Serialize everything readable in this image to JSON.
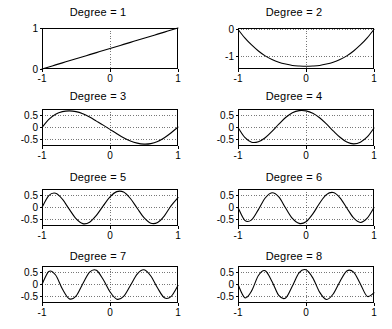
{
  "figure": {
    "kind": "small-multiples-grid",
    "rows": 4,
    "cols": 2,
    "background": "#ffffff",
    "line_color": "#000000",
    "grid_color": "#555555",
    "axis_color": "#000000"
  },
  "chart_data": [
    {
      "type": "line",
      "title": "Degree = 1",
      "xlabel": "",
      "ylabel": "",
      "xlim": [
        -1,
        1
      ],
      "ylim": [
        0,
        1
      ],
      "xticks": [
        -1,
        0,
        1
      ],
      "xticklabels": [
        "-1",
        "0",
        "1"
      ],
      "yticks": [
        0,
        1
      ],
      "yticklabels": [
        "0",
        "1"
      ],
      "grid": true,
      "series": [
        {
          "name": "basis-1",
          "x": [
            -1,
            -0.9,
            -0.8,
            -0.7,
            -0.6,
            -0.5,
            -0.4,
            -0.3,
            -0.2,
            -0.1,
            0,
            0.1,
            0.2,
            0.3,
            0.4,
            0.5,
            0.6,
            0.7,
            0.8,
            0.9,
            1
          ],
          "y": [
            0,
            0.05,
            0.1,
            0.15,
            0.2,
            0.25,
            0.3,
            0.35,
            0.4,
            0.45,
            0.5,
            0.55,
            0.6,
            0.65,
            0.7,
            0.75,
            0.8,
            0.85,
            0.9,
            0.95,
            1
          ]
        }
      ]
    },
    {
      "type": "line",
      "title": "Degree = 2",
      "xlabel": "",
      "ylabel": "",
      "xlim": [
        -1,
        1
      ],
      "ylim": [
        -1.45,
        0.05
      ],
      "xticks": [
        -1,
        0,
        1
      ],
      "xticklabels": [
        "-1",
        "0",
        "1"
      ],
      "yticks": [
        0,
        -1
      ],
      "yticklabels": [
        "0",
        "-1"
      ],
      "grid": true,
      "series": [
        {
          "name": "basis-2",
          "x": [
            -1,
            -0.9,
            -0.8,
            -0.7,
            -0.6,
            -0.5,
            -0.4,
            -0.3,
            -0.2,
            -0.1,
            0,
            0.1,
            0.2,
            0.3,
            0.4,
            0.5,
            0.6,
            0.7,
            0.8,
            0.9,
            1
          ],
          "y": [
            0,
            -0.31,
            -0.57,
            -0.79,
            -0.97,
            -1.1,
            -1.2,
            -1.27,
            -1.32,
            -1.34,
            -1.35,
            -1.34,
            -1.32,
            -1.27,
            -1.2,
            -1.1,
            -0.97,
            -0.79,
            -0.57,
            -0.31,
            0
          ]
        }
      ]
    },
    {
      "type": "line",
      "title": "Degree = 3",
      "xlabel": "",
      "ylabel": "",
      "xlim": [
        -1,
        1
      ],
      "ylim": [
        -0.78,
        0.78
      ],
      "xticks": [
        -1,
        0,
        1
      ],
      "xticklabels": [
        "-1",
        "0",
        "1"
      ],
      "yticks": [
        0.5,
        0,
        -0.5
      ],
      "yticklabels": [
        "0.5",
        "0",
        "-0.5"
      ],
      "grid": true,
      "series": [
        {
          "name": "basis-3",
          "x": [
            -1,
            -0.9,
            -0.8,
            -0.7,
            -0.6,
            -0.5,
            -0.4,
            -0.3,
            -0.2,
            -0.1,
            0,
            0.1,
            0.2,
            0.3,
            0.4,
            0.5,
            0.6,
            0.7,
            0.8,
            0.9,
            1
          ],
          "y": [
            0,
            0.34,
            0.56,
            0.67,
            0.7,
            0.67,
            0.58,
            0.44,
            0.27,
            0.1,
            -0.08,
            -0.26,
            -0.43,
            -0.57,
            -0.66,
            -0.7,
            -0.68,
            -0.59,
            -0.43,
            -0.22,
            0.02
          ]
        }
      ]
    },
    {
      "type": "line",
      "title": "Degree = 4",
      "xlabel": "",
      "ylabel": "",
      "xlim": [
        -1,
        1
      ],
      "ylim": [
        -0.78,
        0.78
      ],
      "xticks": [
        -1,
        0,
        1
      ],
      "xticklabels": [
        "-1",
        "0",
        "1"
      ],
      "yticks": [
        0.5,
        0,
        -0.5
      ],
      "yticklabels": [
        "0.5",
        "0",
        "-0.5"
      ],
      "grid": true,
      "series": [
        {
          "name": "basis-4",
          "x": [
            -1,
            -0.9,
            -0.8,
            -0.7,
            -0.6,
            -0.5,
            -0.4,
            -0.3,
            -0.2,
            -0.1,
            0,
            0.1,
            0.2,
            0.3,
            0.4,
            0.5,
            0.6,
            0.7,
            0.8,
            0.9,
            1
          ],
          "y": [
            0,
            -0.42,
            -0.62,
            -0.6,
            -0.43,
            -0.16,
            0.14,
            0.42,
            0.62,
            0.71,
            0.7,
            0.6,
            0.41,
            0.15,
            -0.14,
            -0.41,
            -0.61,
            -0.69,
            -0.62,
            -0.4,
            -0.02
          ]
        }
      ]
    },
    {
      "type": "line",
      "title": "Degree = 5",
      "xlabel": "",
      "ylabel": "",
      "xlim": [
        -1,
        1
      ],
      "ylim": [
        -0.78,
        0.78
      ],
      "xticks": [
        -1,
        0,
        1
      ],
      "xticklabels": [
        "-1",
        "0",
        "1"
      ],
      "yticks": [
        0.5,
        0,
        -0.5
      ],
      "yticklabels": [
        "0.5",
        "0",
        "-0.5"
      ],
      "grid": true,
      "series": [
        {
          "name": "basis-5",
          "x": [
            -1,
            -0.9,
            -0.8,
            -0.7,
            -0.6,
            -0.5,
            -0.4,
            -0.3,
            -0.2,
            -0.1,
            0,
            0.1,
            0.2,
            0.3,
            0.4,
            0.5,
            0.6,
            0.7,
            0.8,
            0.9,
            1
          ],
          "y": [
            0,
            0.5,
            0.6,
            0.35,
            -0.07,
            -0.47,
            -0.68,
            -0.62,
            -0.33,
            0.07,
            0.45,
            0.67,
            0.65,
            0.38,
            -0.03,
            -0.43,
            -0.66,
            -0.63,
            -0.35,
            0.08,
            0.42
          ]
        }
      ]
    },
    {
      "type": "line",
      "title": "Degree = 6",
      "xlabel": "",
      "ylabel": "",
      "xlim": [
        -1,
        1
      ],
      "ylim": [
        -0.78,
        0.78
      ],
      "xticks": [
        -1,
        0,
        1
      ],
      "xticklabels": [
        "-1",
        "0",
        "1"
      ],
      "yticks": [
        0.5,
        0,
        -0.5
      ],
      "yticklabels": [
        "0.5",
        "0",
        "-0.5"
      ],
      "grid": true,
      "series": [
        {
          "name": "basis-6",
          "x": [
            -1,
            -0.9,
            -0.8,
            -0.7,
            -0.6,
            -0.5,
            -0.4,
            -0.3,
            -0.2,
            -0.1,
            0,
            0.1,
            0.2,
            0.3,
            0.4,
            0.5,
            0.6,
            0.7,
            0.8,
            0.9,
            1
          ],
          "y": [
            0,
            -0.54,
            -0.52,
            -0.09,
            0.4,
            0.62,
            0.45,
            -0.02,
            -0.46,
            -0.67,
            -0.6,
            -0.27,
            0.18,
            0.54,
            0.63,
            0.41,
            -0.02,
            -0.44,
            -0.63,
            -0.45,
            0.0
          ]
        }
      ]
    },
    {
      "type": "line",
      "title": "Degree = 7",
      "xlabel": "",
      "ylabel": "",
      "xlim": [
        -1,
        1
      ],
      "ylim": [
        -0.78,
        0.78
      ],
      "xticks": [
        -1,
        0,
        1
      ],
      "xticklabels": [
        "-1",
        "0",
        "1"
      ],
      "yticks": [
        0.5,
        0,
        -0.5
      ],
      "yticklabels": [
        "0.5",
        "0",
        "-0.5"
      ],
      "grid": true,
      "series": [
        {
          "name": "basis-7",
          "x": [
            -1,
            -0.9,
            -0.8,
            -0.7,
            -0.6,
            -0.5,
            -0.4,
            -0.3,
            -0.2,
            -0.1,
            0,
            0.1,
            0.2,
            0.3,
            0.4,
            0.5,
            0.6,
            0.7,
            0.8,
            0.9,
            1
          ],
          "y": [
            0,
            0.55,
            0.4,
            -0.19,
            -0.6,
            -0.49,
            0.03,
            0.52,
            0.6,
            0.21,
            -0.31,
            -0.62,
            -0.5,
            -0.04,
            0.44,
            0.62,
            0.36,
            -0.15,
            -0.56,
            -0.5,
            -0.04
          ]
        }
      ]
    },
    {
      "type": "line",
      "title": "Degree = 8",
      "xlabel": "",
      "ylabel": "",
      "xlim": [
        -1,
        1
      ],
      "ylim": [
        -0.78,
        0.78
      ],
      "xticks": [
        -1,
        0,
        1
      ],
      "xticklabels": [
        "-1",
        "0",
        "1"
      ],
      "yticks": [
        0.5,
        0,
        -0.5
      ],
      "yticklabels": [
        "0.5",
        "0",
        "-0.5"
      ],
      "grid": true,
      "series": [
        {
          "name": "basis-8",
          "x": [
            -1,
            -0.9,
            -0.8,
            -0.7,
            -0.6,
            -0.5,
            -0.4,
            -0.3,
            -0.2,
            -0.1,
            0,
            0.1,
            0.2,
            0.3,
            0.4,
            0.5,
            0.6,
            0.7,
            0.8,
            0.9,
            1
          ],
          "y": [
            0,
            -0.56,
            -0.27,
            0.38,
            0.58,
            0.13,
            -0.46,
            -0.57,
            -0.06,
            0.5,
            0.62,
            0.28,
            -0.32,
            -0.63,
            -0.4,
            0.13,
            0.57,
            0.52,
            0.02,
            -0.5,
            -0.35
          ]
        }
      ]
    }
  ]
}
